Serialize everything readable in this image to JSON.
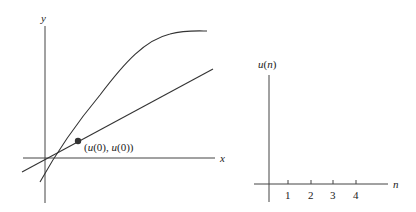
{
  "left_plot": {
    "x_label": "x",
    "y_label": "y",
    "point_label": "(u(0), u(0))",
    "point_label_parts": [
      "(",
      "u",
      "(0), ",
      "u",
      "(0))"
    ]
  },
  "right_plot": {
    "y_label": "u(n)",
    "y_label_parts": [
      "u",
      "(",
      "n",
      ")"
    ],
    "x_label": "n",
    "ticks": [
      "1",
      "2",
      "3",
      "4"
    ]
  },
  "colors": {
    "line": "#333333",
    "point": "#333333",
    "background": "#ffffff"
  }
}
